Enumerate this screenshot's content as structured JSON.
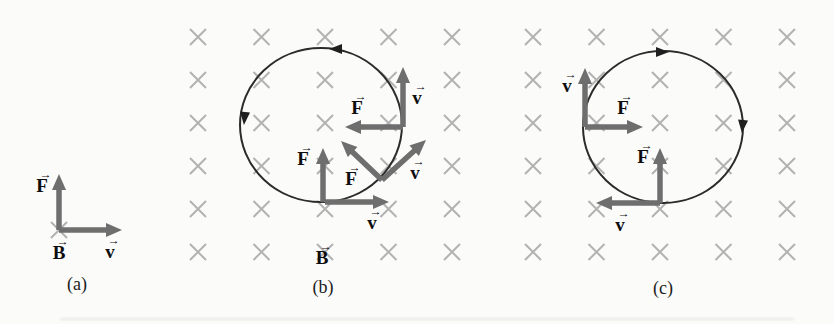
{
  "figure": {
    "over_arrow": "→",
    "colors": {
      "background": "#fbfbfa",
      "field_mark": "#b2b2b2",
      "vector_arrow": "#6e6e6e",
      "orbit_stroke": "#2b2b2b",
      "motion_arrowhead": "#1f1f1f",
      "label_text": "#0d0d0d"
    },
    "field_symbol": "x-cross (field into page)",
    "panels": [
      {
        "caption": "(a)",
        "caption_pos": {
          "x": 77,
          "y": 284
        },
        "field_marks": {
          "points": [
            [
              59,
              230
            ]
          ]
        },
        "vectors": [
          {
            "name": "force",
            "label": "F",
            "from": [
              59,
              230
            ],
            "to": [
              59,
              174
            ],
            "label_pos": [
              42,
              183
            ]
          },
          {
            "name": "velocity",
            "label": "v",
            "from": [
              59,
              230
            ],
            "to": [
              122,
              230
            ],
            "label_pos": [
              110,
              249
            ]
          }
        ],
        "field_label": {
          "label": "B",
          "pos": [
            59,
            250
          ]
        }
      },
      {
        "caption": "(b)",
        "caption_pos": {
          "x": 323,
          "y": 287
        },
        "field_marks": {
          "grid": {
            "x0": 198,
            "y0": 37,
            "cols": 5,
            "rows": 6,
            "dx": 63.5,
            "dy": 43
          }
        },
        "orbit": {
          "cx": 321,
          "cy": 125,
          "rx": 81,
          "ry": 77,
          "direction": "counterclockwise",
          "motion_arrowheads": [
            {
              "x": 330,
              "y": 49,
              "angle": 180
            },
            {
              "x": 244,
              "y": 124,
              "angle": 95
            }
          ]
        },
        "vectors": [
          {
            "name": "velocity",
            "label": "v",
            "from": [
              403,
              127
            ],
            "to": [
              403,
              67
            ],
            "label_pos": [
              417,
              95
            ]
          },
          {
            "name": "force",
            "label": "F",
            "from": [
              403,
              127
            ],
            "to": [
              345,
              127
            ],
            "label_pos": [
              357,
              105
            ]
          },
          {
            "name": "force",
            "label": "F",
            "from": [
              323,
              202
            ],
            "to": [
              323,
              148
            ],
            "label_pos": [
              303,
              156
            ]
          },
          {
            "name": "velocity",
            "label": "v",
            "from": [
              325,
              202
            ],
            "to": [
              389,
              202
            ],
            "label_pos": [
              372,
              220
            ]
          },
          {
            "name": "velocity",
            "label": "v",
            "from": [
              382,
              180
            ],
            "to": [
              426,
              140
            ],
            "label_pos": [
              415,
              170
            ]
          },
          {
            "name": "force",
            "label": "F",
            "from": [
              382,
              180
            ],
            "to": [
              341,
              141
            ],
            "label_pos": [
              351,
              176
            ]
          }
        ],
        "field_label": {
          "label": "B",
          "pos": [
            322,
            255
          ]
        }
      },
      {
        "caption": "(c)",
        "caption_pos": {
          "x": 663,
          "y": 288
        },
        "field_marks": {
          "grid": {
            "x0": 533,
            "y0": 37,
            "cols": 5,
            "rows": 6,
            "dx": 63.5,
            "dy": 43
          }
        },
        "orbit": {
          "cx": 663,
          "cy": 127,
          "rx": 80,
          "ry": 76,
          "direction": "clockwise",
          "motion_arrowheads": [
            {
              "x": 668,
              "y": 52,
              "angle": 0
            },
            {
              "x": 742,
              "y": 132,
              "angle": 95
            }
          ]
        },
        "vectors": [
          {
            "name": "velocity",
            "label": "v",
            "from": [
              585,
              127
            ],
            "to": [
              585,
              68
            ],
            "label_pos": [
              567,
              83
            ]
          },
          {
            "name": "force",
            "label": "F",
            "from": [
              585,
              127
            ],
            "to": [
              643,
              127
            ],
            "label_pos": [
              623,
              105
            ]
          },
          {
            "name": "force",
            "label": "F",
            "from": [
              660,
              203
            ],
            "to": [
              660,
              148
            ],
            "label_pos": [
              643,
              154
            ]
          },
          {
            "name": "velocity",
            "label": "v",
            "from": [
              660,
              203
            ],
            "to": [
              596,
              203
            ],
            "label_pos": [
              620,
              222
            ]
          }
        ]
      }
    ]
  }
}
